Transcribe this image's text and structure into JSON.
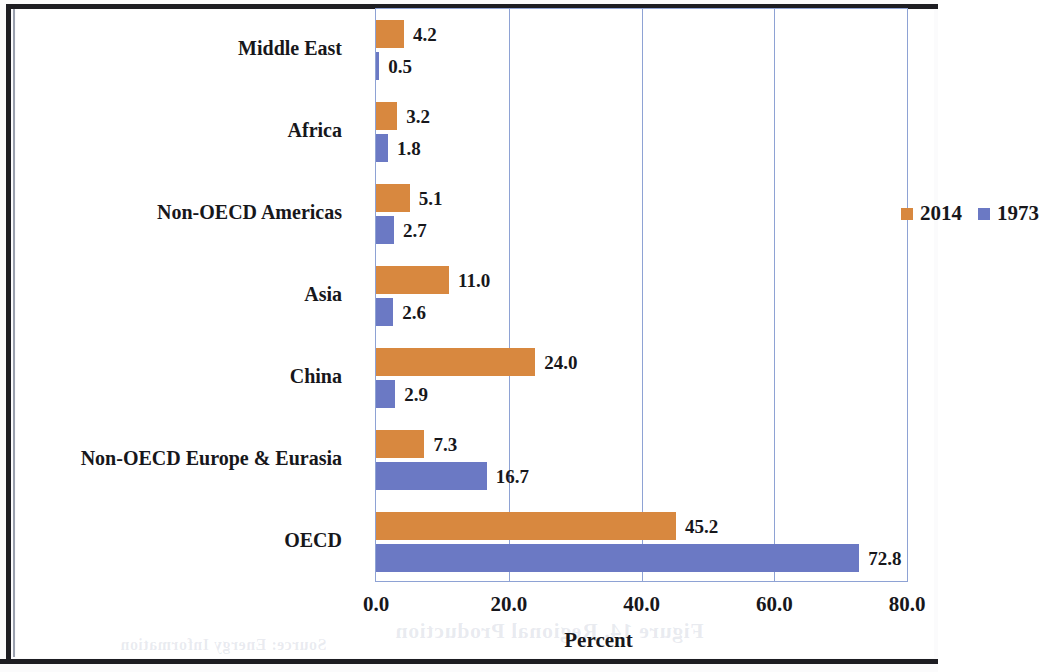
{
  "chart_data": {
    "type": "bar",
    "orientation": "horizontal",
    "title": "",
    "xlabel": "Percent",
    "ylabel": "",
    "xlim": [
      0,
      80
    ],
    "xticks": [
      "0.0",
      "20.0",
      "40.0",
      "60.0",
      "80.0"
    ],
    "xtick_values": [
      0,
      20,
      40,
      60,
      80
    ],
    "grid": "vertical",
    "legend_position": "inside-upper-center",
    "categories": [
      "Middle East",
      "Africa",
      "Non-OECD Americas",
      "Asia",
      "China",
      "Non-OECD Europe & Eurasia",
      "OECD"
    ],
    "series": [
      {
        "name": "2014",
        "color": "#d8883f",
        "values": [
          4.2,
          3.2,
          5.1,
          11.0,
          24.0,
          7.3,
          45.2
        ],
        "labels": [
          "4.2",
          "3.2",
          "5.1",
          "11.0",
          "24.0",
          "7.3",
          "45.2"
        ]
      },
      {
        "name": "1973",
        "color": "#6b79c4",
        "values": [
          0.5,
          1.8,
          2.7,
          2.6,
          2.9,
          16.7,
          72.8
        ],
        "labels": [
          "0.5",
          "1.8",
          "2.7",
          "2.6",
          "2.9",
          "16.7",
          "72.8"
        ]
      }
    ]
  },
  "legend": {
    "items": [
      {
        "label": "2014",
        "color": "#d8883f"
      },
      {
        "label": "1973",
        "color": "#6b79c4"
      }
    ]
  },
  "axis": {
    "x_title": "Percent"
  },
  "page": {
    "ghost_text": {
      "g1": "",
      "g2": "",
      "g3": "",
      "g4": "",
      "g5": "Figure 14. Regional Production",
      "g6": "Source: Energy Information"
    }
  }
}
